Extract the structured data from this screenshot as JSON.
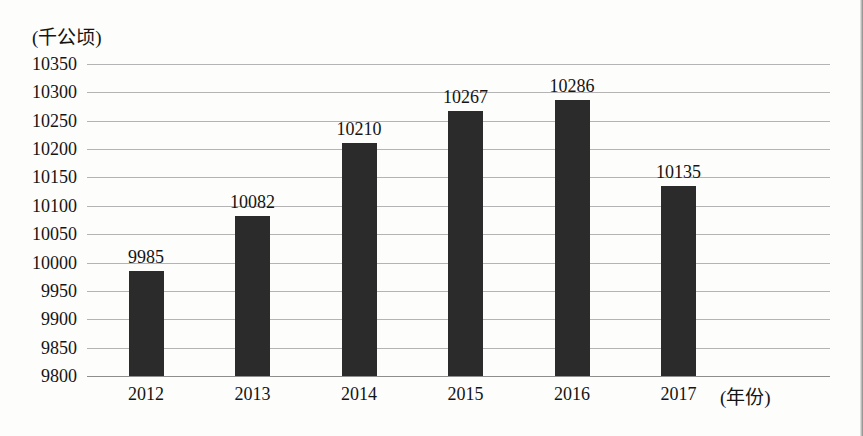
{
  "chart_data": {
    "type": "bar",
    "title": "",
    "subtitle": "",
    "xlabel": "(年份)",
    "ylabel": "(千公顷)",
    "categories": [
      "2012",
      "2013",
      "2014",
      "2015",
      "2016",
      "2017"
    ],
    "values": [
      9985,
      10082,
      10210,
      10267,
      10286,
      10135
    ],
    "value_labels": [
      "9985",
      "10082",
      "10210",
      "10267",
      "10286",
      "10135"
    ],
    "series": [
      {
        "name": "",
        "values": [
          9985,
          10082,
          10210,
          10267,
          10286,
          10135
        ]
      }
    ],
    "ylim": [
      9800,
      10350
    ],
    "ytick_step": 50,
    "ytick_labels": [
      "10350",
      "10300",
      "10250",
      "10200",
      "10150",
      "10100",
      "10050",
      "10000",
      "9950",
      "9900",
      "9850",
      "9800"
    ],
    "ytick_values": [
      10350,
      10300,
      10250,
      10200,
      10150,
      10100,
      10050,
      10000,
      9950,
      9900,
      9850,
      9800
    ],
    "grid": true,
    "grid_axis": "y",
    "legend": false,
    "legend_position": "none",
    "bar_color": "#2b2b2b",
    "grid_color": "#b4b4b4",
    "axis_color": "#8e8e8e",
    "background_color": "#fdfdfc",
    "text_color": "#141414"
  }
}
